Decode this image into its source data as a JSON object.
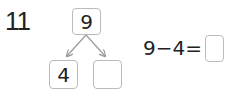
{
  "problem": {
    "number": "11",
    "tree": {
      "top": "9",
      "left": "4",
      "right": ""
    },
    "equation": {
      "text": "9−4=",
      "answer": ""
    }
  }
}
